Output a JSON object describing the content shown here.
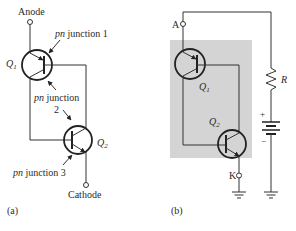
{
  "figure": {
    "panel_a": {
      "caption": "(a)",
      "anode_label": "Anode",
      "cathode_label": "Cathode",
      "q1_label": "Q",
      "q1_sub": "1",
      "q2_label": "Q",
      "q2_sub": "2",
      "junction1": {
        "italic": "pn",
        "text": " junction 1"
      },
      "junction2": {
        "italic": "pn",
        "text": " junction",
        "line2": "2"
      },
      "junction3": {
        "italic": "pn",
        "text": " junction 3"
      }
    },
    "panel_b": {
      "caption": "(b)",
      "anode_terminal": "A",
      "cathode_terminal": "K",
      "q1_label": "Q",
      "q1_sub": "1",
      "q2_label": "Q",
      "q2_sub": "2",
      "resistor_label": "R",
      "battery_plus": "+",
      "battery_minus": "−"
    },
    "colors": {
      "shade": "#d4d4d4",
      "line": "#333333"
    }
  }
}
